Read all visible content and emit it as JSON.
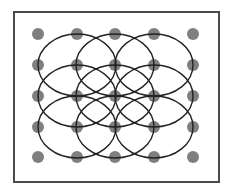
{
  "diagram": {
    "frame": {
      "x": 14,
      "y": 12,
      "width": 205,
      "height": 170,
      "stroke": "#4a4a4a"
    },
    "dot_color": "#7f7f7f",
    "dot_radius": 6,
    "grid_x": [
      38,
      77,
      115,
      154,
      193
    ],
    "grid_y": [
      34,
      65,
      96,
      127,
      157
    ],
    "circle_stroke": "#222222",
    "circle_rx": 39,
    "circle_ry": 31,
    "circle_centers": [
      [
        77,
        65
      ],
      [
        115,
        65
      ],
      [
        154,
        65
      ],
      [
        77,
        96
      ],
      [
        115,
        96
      ],
      [
        154,
        96
      ],
      [
        77,
        127
      ],
      [
        115,
        127
      ],
      [
        154,
        127
      ]
    ]
  }
}
